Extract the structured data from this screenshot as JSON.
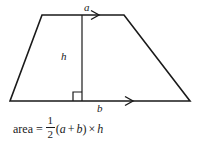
{
  "figure": {
    "name": "trapezoid-area-diagram",
    "shape": "trapezoid",
    "stroke_color": "#1a1a1a",
    "background_color": "#ffffff",
    "labels": {
      "top_side": "a",
      "height": "h",
      "bottom_side": "b"
    },
    "markers": {
      "right_angle": "right-angle-square",
      "parallel_top": "arrow-right",
      "parallel_bottom": "arrow-right"
    },
    "geometry": {
      "top_left": [
        42,
        15
      ],
      "top_right": [
        124,
        15
      ],
      "bottom_right": [
        190,
        101
      ],
      "bottom_left": [
        10,
        101
      ],
      "height_line_x": 82,
      "height_line_top_y": 15,
      "height_line_bottom_y": 101,
      "right_angle_size": 9,
      "top_arrow_x": 96,
      "bottom_arrow_x": 130
    }
  },
  "formula": {
    "full_text": "area = 1/2 (a + b) × h",
    "area_word": "area",
    "equals": "=",
    "fraction_numerator": "1",
    "fraction_denominator": "2",
    "open_paren": "(",
    "var_a": "a",
    "plus": "+",
    "var_b": "b",
    "close_paren": ")",
    "times": "×",
    "var_h": "h"
  }
}
